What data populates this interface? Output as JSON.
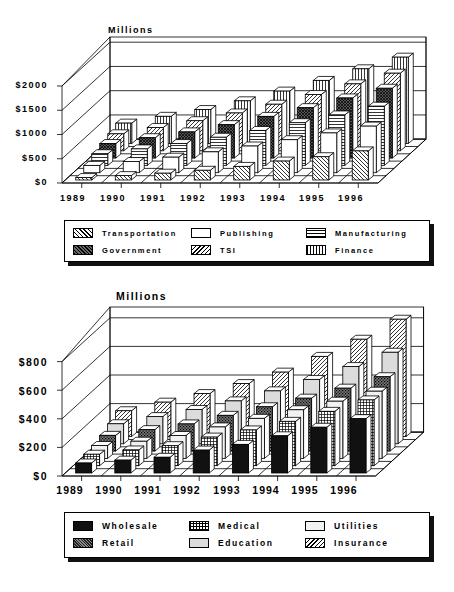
{
  "charts": [
    {
      "id": "chart1",
      "unit_label": "Millions",
      "y_ticks": [
        "$0",
        "$500",
        "$1000",
        "$1500",
        "$2000"
      ],
      "x_ticks": [
        "1989",
        "1990",
        "1991",
        "1992",
        "1993",
        "1994",
        "1995",
        "1996"
      ],
      "legend": [
        {
          "name": "Transportation",
          "pattern": "diag-back"
        },
        {
          "name": "Publishing",
          "pattern": "white"
        },
        {
          "name": "Manufacturing",
          "pattern": "horiz"
        },
        {
          "name": "Government",
          "pattern": "crosshatch-dark"
        },
        {
          "name": "TSI",
          "pattern": "diag-fwd"
        },
        {
          "name": "Finance",
          "pattern": "vert"
        }
      ]
    },
    {
      "id": "chart2",
      "unit_label": "Millions",
      "y_ticks": [
        "$0",
        "$200",
        "$400",
        "$600",
        "$800"
      ],
      "x_ticks": [
        "1989",
        "1990",
        "1991",
        "1992",
        "1993",
        "1994",
        "1995",
        "1996"
      ],
      "legend": [
        {
          "name": "Wholesale",
          "pattern": "black"
        },
        {
          "name": "Medical",
          "pattern": "grid"
        },
        {
          "name": "Utilities",
          "pattern": "light"
        },
        {
          "name": "Retail",
          "pattern": "dots-dark"
        },
        {
          "name": "Education",
          "pattern": "lightgray"
        },
        {
          "name": "Insurance",
          "pattern": "diag-fwd"
        }
      ]
    }
  ],
  "chart_data": [
    {
      "type": "bar",
      "subtype": "3d-bar",
      "title": "",
      "ylabel": "Millions",
      "xlabel": "",
      "ylim": [
        0,
        2000
      ],
      "y_ticks": [
        0,
        500,
        1000,
        1500,
        2000
      ],
      "categories": [
        "1989",
        "1990",
        "1991",
        "1992",
        "1993",
        "1994",
        "1995",
        "1996"
      ],
      "legend_position": "bottom",
      "grid": true,
      "series": [
        {
          "name": "Transportation",
          "values": [
            50,
            90,
            140,
            200,
            280,
            390,
            480,
            600
          ]
        },
        {
          "name": "Publishing",
          "values": [
            150,
            230,
            320,
            430,
            550,
            680,
            820,
            960
          ]
        },
        {
          "name": "Manufacturing",
          "values": [
            240,
            340,
            450,
            580,
            720,
            880,
            1040,
            1220
          ]
        },
        {
          "name": "Government",
          "values": [
            300,
            420,
            540,
            690,
            860,
            1040,
            1240,
            1440
          ]
        },
        {
          "name": "TSI",
          "values": [
            350,
            480,
            620,
            780,
            960,
            1160,
            1380,
            1600
          ]
        },
        {
          "name": "Finance",
          "values": [
            420,
            560,
            700,
            880,
            1080,
            1300,
            1540,
            1780
          ]
        }
      ]
    },
    {
      "type": "bar",
      "subtype": "3d-bar",
      "title": "",
      "ylabel": "Millions",
      "xlabel": "",
      "ylim": [
        0,
        800
      ],
      "y_ticks": [
        0,
        200,
        400,
        600,
        800
      ],
      "categories": [
        "1989",
        "1990",
        "1991",
        "1992",
        "1993",
        "1994",
        "1995",
        "1996"
      ],
      "legend_position": "bottom",
      "grid": true,
      "series": [
        {
          "name": "Wholesale",
          "values": [
            70,
            90,
            110,
            160,
            200,
            260,
            320,
            380
          ]
        },
        {
          "name": "Medical",
          "values": [
            80,
            110,
            140,
            200,
            250,
            310,
            380,
            460
          ]
        },
        {
          "name": "Utilities",
          "values": [
            90,
            120,
            160,
            220,
            280,
            340,
            400,
            470
          ]
        },
        {
          "name": "Retail",
          "values": [
            110,
            150,
            190,
            250,
            310,
            370,
            440,
            520
          ]
        },
        {
          "name": "Education",
          "values": [
            140,
            190,
            240,
            300,
            370,
            450,
            540,
            640
          ]
        },
        {
          "name": "Insurance",
          "values": [
            180,
            240,
            300,
            370,
            450,
            560,
            680,
            820
          ]
        }
      ]
    }
  ]
}
